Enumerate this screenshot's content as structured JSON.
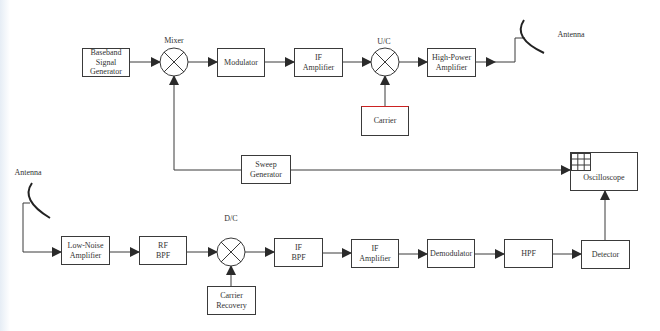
{
  "diagram": {
    "title": "",
    "transmitter": {
      "baseband": "Baseband\nSignal\nGenerator",
      "mixer_label": "Mixer",
      "modulator": "Modulator",
      "if_amplifier": "IF\nAmplifier",
      "uc_label": "U/C",
      "carrier": "Carrier",
      "hpa": "High-Power\nAmplifier",
      "antenna_label": "Antenna"
    },
    "sweep": {
      "sweep_generator": "Sweep\nGenerator",
      "oscilloscope": "Oscilloscope"
    },
    "receiver": {
      "antenna_label": "Antenna",
      "lna": "Low-Noise\nAmplifier",
      "rf_bpf": "RF\nBPF",
      "dc_label": "D/C",
      "carrier_recovery": "Carrier\nRecovery",
      "if_bpf": "IF\nBPF",
      "if_amplifier": "IF\nAmplifier",
      "demodulator": "Demodulator",
      "hpf": "HPF",
      "detector": "Detector"
    },
    "colors": {
      "line": "#3a3a3a",
      "carrier_top_border": "#cc2222",
      "background": "#ffffff"
    }
  }
}
